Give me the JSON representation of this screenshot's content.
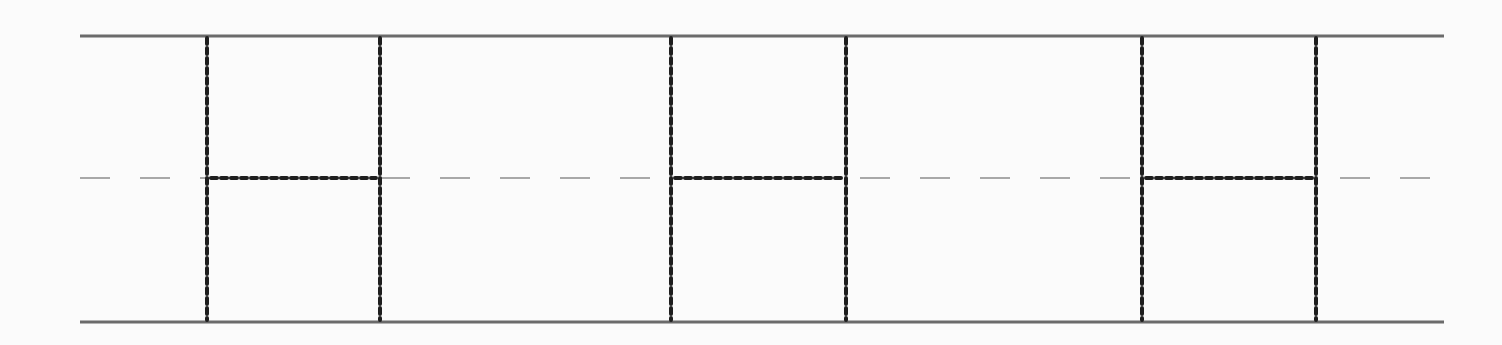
{
  "canvas": {
    "width": 1502,
    "height": 345,
    "background": "#fbfbfb"
  },
  "rails": {
    "x_start": 80,
    "x_end": 1444,
    "top_y": 36,
    "bottom_y": 322,
    "color": "#6b6b6b",
    "width": 3
  },
  "centerline": {
    "y": 178,
    "x_start": 80,
    "x_end": 1444,
    "color": "#a8a8a8",
    "width": 2,
    "dash": "30 30"
  },
  "boxes": [
    {
      "id": "box-1",
      "x_left": 207,
      "x_right": 380
    },
    {
      "id": "box-2",
      "x_left": 671,
      "x_right": 846
    },
    {
      "id": "box-3",
      "x_left": 1142,
      "x_right": 1316
    }
  ],
  "box_style": {
    "top_y": 38,
    "bottom_y": 320,
    "mid_y": 178,
    "color": "#1e1e1e",
    "width": 4,
    "dash": "6 4"
  }
}
